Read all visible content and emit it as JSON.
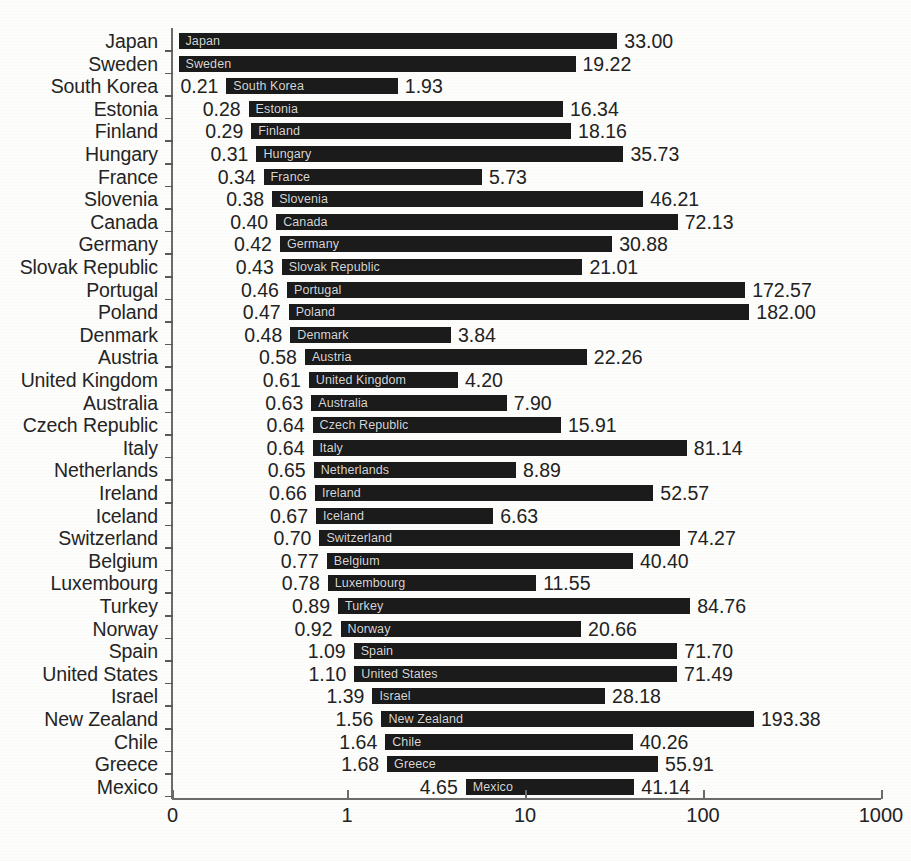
{
  "chart_data": {
    "type": "bar",
    "subtype": "horizontal-range-bar",
    "title": "",
    "subtitle": "",
    "xlabel": "",
    "ylabel": "",
    "xscale": "log",
    "xlim": [
      1,
      1000
    ],
    "xticks": [
      "0",
      "1",
      "10",
      "100",
      "1000"
    ],
    "xtick_values": [
      0,
      1,
      10,
      100,
      1000
    ],
    "grid": false,
    "legend": null,
    "categories": [
      "Japan",
      "Sweden",
      "South Korea",
      "Estonia",
      "Finland",
      "Hungary",
      "France",
      "Slovenia",
      "Canada",
      "Germany",
      "Slovak Republic",
      "Portugal",
      "Poland",
      "Denmark",
      "Austria",
      "United Kingdom",
      "Australia",
      "Czech Republic",
      "Italy",
      "Netherlands",
      "Ireland",
      "Iceland",
      "Switzerland",
      "Belgium",
      "Luxembourg",
      "Turkey",
      "Norway",
      "Spain",
      "United States",
      "Israel",
      "New Zealand",
      "Chile",
      "Greece",
      "Mexico"
    ],
    "series": [
      {
        "name": "minimum",
        "values": [
          null,
          null,
          0.21,
          0.28,
          0.29,
          0.31,
          0.34,
          0.38,
          0.4,
          0.42,
          0.43,
          0.46,
          0.47,
          0.48,
          0.58,
          0.61,
          0.63,
          0.64,
          0.64,
          0.65,
          0.66,
          0.67,
          0.7,
          0.77,
          0.78,
          0.89,
          0.92,
          1.09,
          1.1,
          1.39,
          1.56,
          1.64,
          1.68,
          4.65
        ]
      },
      {
        "name": "maximum",
        "values": [
          33.0,
          19.22,
          1.93,
          16.34,
          18.16,
          35.73,
          5.73,
          46.21,
          72.13,
          30.88,
          21.01,
          172.57,
          182.0,
          3.84,
          22.26,
          4.2,
          7.9,
          15.91,
          81.14,
          8.89,
          52.57,
          6.63,
          74.27,
          40.4,
          11.55,
          84.76,
          20.66,
          71.7,
          71.49,
          28.18,
          193.38,
          40.26,
          55.91,
          41.14
        ]
      }
    ],
    "rows": [
      {
        "category": "Japan",
        "min": null,
        "max": 33.0,
        "min_label": "",
        "max_label": "33.00",
        "bar_label": "Japan"
      },
      {
        "category": "Sweden",
        "min": null,
        "max": 19.22,
        "min_label": "",
        "max_label": "19.22",
        "bar_label": "Sweden"
      },
      {
        "category": "South Korea",
        "min": 0.21,
        "max": 1.93,
        "min_label": "0.21",
        "max_label": "1.93",
        "bar_label": "South Korea"
      },
      {
        "category": "Estonia",
        "min": 0.28,
        "max": 16.34,
        "min_label": "0.28",
        "max_label": "16.34",
        "bar_label": "Estonia"
      },
      {
        "category": "Finland",
        "min": 0.29,
        "max": 18.16,
        "min_label": "0.29",
        "max_label": "18.16",
        "bar_label": "Finland"
      },
      {
        "category": "Hungary",
        "min": 0.31,
        "max": 35.73,
        "min_label": "0.31",
        "max_label": "35.73",
        "bar_label": "Hungary"
      },
      {
        "category": "France",
        "min": 0.34,
        "max": 5.73,
        "min_label": "0.34",
        "max_label": "5.73",
        "bar_label": "France"
      },
      {
        "category": "Slovenia",
        "min": 0.38,
        "max": 46.21,
        "min_label": "0.38",
        "max_label": "46.21",
        "bar_label": "Slovenia"
      },
      {
        "category": "Canada",
        "min": 0.4,
        "max": 72.13,
        "min_label": "0.40",
        "max_label": "72.13",
        "bar_label": "Canada"
      },
      {
        "category": "Germany",
        "min": 0.42,
        "max": 30.88,
        "min_label": "0.42",
        "max_label": "30.88",
        "bar_label": "Germany"
      },
      {
        "category": "Slovak Republic",
        "min": 0.43,
        "max": 21.01,
        "min_label": "0.43",
        "max_label": "21.01",
        "bar_label": "Slovak Republic"
      },
      {
        "category": "Portugal",
        "min": 0.46,
        "max": 172.57,
        "min_label": "0.46",
        "max_label": "172.57",
        "bar_label": "Portugal"
      },
      {
        "category": "Poland",
        "min": 0.47,
        "max": 182.0,
        "min_label": "0.47",
        "max_label": "182.00",
        "bar_label": "Poland"
      },
      {
        "category": "Denmark",
        "min": 0.48,
        "max": 3.84,
        "min_label": "0.48",
        "max_label": "3.84",
        "bar_label": "Denmark"
      },
      {
        "category": "Austria",
        "min": 0.58,
        "max": 22.26,
        "min_label": "0.58",
        "max_label": "22.26",
        "bar_label": "Austria"
      },
      {
        "category": "United Kingdom",
        "min": 0.61,
        "max": 4.2,
        "min_label": "0.61",
        "max_label": "4.20",
        "bar_label": "United Kingdom"
      },
      {
        "category": "Australia",
        "min": 0.63,
        "max": 7.9,
        "min_label": "0.63",
        "max_label": "7.90",
        "bar_label": "Australia"
      },
      {
        "category": "Czech Republic",
        "min": 0.64,
        "max": 15.91,
        "min_label": "0.64",
        "max_label": "15.91",
        "bar_label": "Czech Republic"
      },
      {
        "category": "Italy",
        "min": 0.64,
        "max": 81.14,
        "min_label": "0.64",
        "max_label": "81.14",
        "bar_label": "Italy"
      },
      {
        "category": "Netherlands",
        "min": 0.65,
        "max": 8.89,
        "min_label": "0.65",
        "max_label": "8.89",
        "bar_label": "Netherlands"
      },
      {
        "category": "Ireland",
        "min": 0.66,
        "max": 52.57,
        "min_label": "0.66",
        "max_label": "52.57",
        "bar_label": "Ireland"
      },
      {
        "category": "Iceland",
        "min": 0.67,
        "max": 6.63,
        "min_label": "0.67",
        "max_label": "6.63",
        "bar_label": "Iceland"
      },
      {
        "category": "Switzerland",
        "min": 0.7,
        "max": 74.27,
        "min_label": "0.70",
        "max_label": "74.27",
        "bar_label": "Switzerland"
      },
      {
        "category": "Belgium",
        "min": 0.77,
        "max": 40.4,
        "min_label": "0.77",
        "max_label": "40.40",
        "bar_label": "Belgium"
      },
      {
        "category": "Luxembourg",
        "min": 0.78,
        "max": 11.55,
        "min_label": "0.78",
        "max_label": "11.55",
        "bar_label": "Luxembourg"
      },
      {
        "category": "Turkey",
        "min": 0.89,
        "max": 84.76,
        "min_label": "0.89",
        "max_label": "84.76",
        "bar_label": "Turkey"
      },
      {
        "category": "Norway",
        "min": 0.92,
        "max": 20.66,
        "min_label": "0.92",
        "max_label": "20.66",
        "bar_label": "Norway"
      },
      {
        "category": "Spain",
        "min": 1.09,
        "max": 71.7,
        "min_label": "1.09",
        "max_label": "71.70",
        "bar_label": "Spain"
      },
      {
        "category": "United States",
        "min": 1.1,
        "max": 71.49,
        "min_label": "1.10",
        "max_label": "71.49",
        "bar_label": "United States"
      },
      {
        "category": "Israel",
        "min": 1.39,
        "max": 28.18,
        "min_label": "1.39",
        "max_label": "28.18",
        "bar_label": "Israel"
      },
      {
        "category": "New Zealand",
        "min": 1.56,
        "max": 193.38,
        "min_label": "1.56",
        "max_label": "193.38",
        "bar_label": "New Zealand"
      },
      {
        "category": "Chile",
        "min": 1.64,
        "max": 40.26,
        "min_label": "1.64",
        "max_label": "40.26",
        "bar_label": "Chile"
      },
      {
        "category": "Greece",
        "min": 1.68,
        "max": 55.91,
        "min_label": "1.68",
        "max_label": "55.91",
        "bar_label": "Greece"
      },
      {
        "category": "Mexico",
        "min": 4.65,
        "max": 41.14,
        "min_label": "4.65",
        "max_label": "41.14",
        "bar_label": "Mexico"
      }
    ]
  },
  "colors": {
    "bar": "#1b1b1b",
    "bar_text": "#d8d8d8",
    "axis": "#6b6b6b",
    "text": "#222222",
    "background": "#fdfdfc"
  }
}
